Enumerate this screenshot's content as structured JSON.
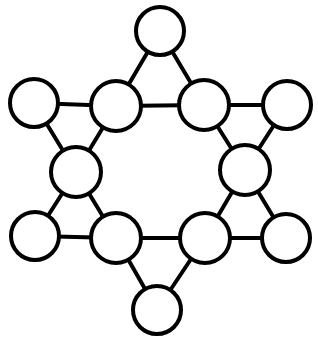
{
  "figure": {
    "name": "star-graph-diagram",
    "background_color": "#ffffff",
    "width": 318,
    "height": 338
  },
  "style": {
    "node_fill": "#ffffff",
    "node_stroke": "#000000",
    "node_stroke_width": 4,
    "edge_color": "#000000",
    "edge_width": 4
  },
  "chart_data": {
    "type": "diagram",
    "layout": "star-of-david",
    "node_count": 12,
    "edge_count": 18,
    "nodes": [
      {
        "id": "outer-top",
        "label": "",
        "role": "outer",
        "cx": 160,
        "cy": 31,
        "r": 24
      },
      {
        "id": "outer-upper-left",
        "label": "",
        "role": "outer",
        "cx": 34,
        "cy": 103,
        "r": 24
      },
      {
        "id": "outer-upper-right",
        "label": "",
        "role": "outer",
        "cx": 287,
        "cy": 105,
        "r": 24
      },
      {
        "id": "outer-lower-left",
        "label": "",
        "role": "outer",
        "cx": 35,
        "cy": 236,
        "r": 24
      },
      {
        "id": "outer-lower-right",
        "label": "",
        "role": "outer",
        "cx": 286,
        "cy": 238,
        "r": 24
      },
      {
        "id": "outer-bottom",
        "label": "",
        "role": "outer",
        "cx": 157,
        "cy": 310,
        "r": 24
      },
      {
        "id": "inner-top-left",
        "label": "",
        "role": "inner",
        "cx": 116,
        "cy": 106,
        "r": 25
      },
      {
        "id": "inner-top-right",
        "label": "",
        "role": "inner",
        "cx": 204,
        "cy": 105,
        "r": 25
      },
      {
        "id": "inner-mid-left",
        "label": "",
        "role": "inner",
        "cx": 76,
        "cy": 172,
        "r": 25
      },
      {
        "id": "inner-mid-right",
        "label": "",
        "role": "inner",
        "cx": 245,
        "cy": 170,
        "r": 25
      },
      {
        "id": "inner-bot-left",
        "label": "",
        "role": "inner",
        "cx": 116,
        "cy": 238,
        "r": 25
      },
      {
        "id": "inner-bot-right",
        "label": "",
        "role": "inner",
        "cx": 205,
        "cy": 238,
        "r": 25
      }
    ],
    "edges": [
      {
        "from": "inner-top-left",
        "to": "inner-top-right",
        "group": "hexagon"
      },
      {
        "from": "inner-top-right",
        "to": "inner-mid-right",
        "group": "hexagon"
      },
      {
        "from": "inner-mid-right",
        "to": "inner-bot-right",
        "group": "hexagon"
      },
      {
        "from": "inner-bot-right",
        "to": "inner-bot-left",
        "group": "hexagon"
      },
      {
        "from": "inner-bot-left",
        "to": "inner-mid-left",
        "group": "hexagon"
      },
      {
        "from": "inner-mid-left",
        "to": "inner-top-left",
        "group": "hexagon"
      },
      {
        "from": "outer-top",
        "to": "inner-top-left",
        "group": "point-top"
      },
      {
        "from": "outer-top",
        "to": "inner-top-right",
        "group": "point-top"
      },
      {
        "from": "outer-upper-left",
        "to": "inner-top-left",
        "group": "point-upper-left"
      },
      {
        "from": "outer-upper-left",
        "to": "inner-mid-left",
        "group": "point-upper-left"
      },
      {
        "from": "outer-upper-right",
        "to": "inner-top-right",
        "group": "point-upper-right"
      },
      {
        "from": "outer-upper-right",
        "to": "inner-mid-right",
        "group": "point-upper-right"
      },
      {
        "from": "outer-lower-left",
        "to": "inner-mid-left",
        "group": "point-lower-left"
      },
      {
        "from": "outer-lower-left",
        "to": "inner-bot-left",
        "group": "point-lower-left"
      },
      {
        "from": "outer-lower-right",
        "to": "inner-mid-right",
        "group": "point-lower-right"
      },
      {
        "from": "outer-lower-right",
        "to": "inner-bot-right",
        "group": "point-lower-right"
      },
      {
        "from": "outer-bottom",
        "to": "inner-bot-left",
        "group": "point-bottom"
      },
      {
        "from": "outer-bottom",
        "to": "inner-bot-right",
        "group": "point-bottom"
      }
    ]
  }
}
